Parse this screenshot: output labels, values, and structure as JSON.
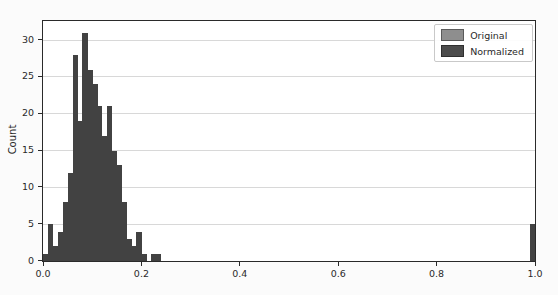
{
  "chart_data": {
    "type": "bar",
    "subtype": "histogram",
    "title": "",
    "xlabel": "",
    "ylabel": "Count",
    "xlim": [
      0.0,
      1.0
    ],
    "ylim": [
      0,
      32.6
    ],
    "x_tick_labels": [
      "0.0",
      "0.2",
      "0.4",
      "0.6",
      "0.8",
      "1.0"
    ],
    "x_tick_values": [
      0.0,
      0.2,
      0.4,
      0.6,
      0.8,
      1.0
    ],
    "y_tick_labels": [
      "0",
      "5",
      "10",
      "15",
      "20",
      "25",
      "30"
    ],
    "y_tick_values": [
      0,
      5,
      10,
      15,
      20,
      25,
      30
    ],
    "grid": "horizontal",
    "bin_width": 0.01,
    "bars": [
      {
        "x": 0.0,
        "count": 1
      },
      {
        "x": 0.01,
        "count": 5
      },
      {
        "x": 0.02,
        "count": 2
      },
      {
        "x": 0.03,
        "count": 4
      },
      {
        "x": 0.04,
        "count": 8
      },
      {
        "x": 0.05,
        "count": 12
      },
      {
        "x": 0.06,
        "count": 28
      },
      {
        "x": 0.07,
        "count": 19
      },
      {
        "x": 0.08,
        "count": 31
      },
      {
        "x": 0.09,
        "count": 26
      },
      {
        "x": 0.1,
        "count": 24
      },
      {
        "x": 0.11,
        "count": 21
      },
      {
        "x": 0.12,
        "count": 17
      },
      {
        "x": 0.13,
        "count": 21
      },
      {
        "x": 0.14,
        "count": 15
      },
      {
        "x": 0.15,
        "count": 13
      },
      {
        "x": 0.16,
        "count": 8
      },
      {
        "x": 0.17,
        "count": 3
      },
      {
        "x": 0.18,
        "count": 2
      },
      {
        "x": 0.19,
        "count": 4
      },
      {
        "x": 0.2,
        "count": 1
      },
      {
        "x": 0.22,
        "count": 1
      },
      {
        "x": 0.23,
        "count": 1
      },
      {
        "x": 0.99,
        "count": 5
      }
    ],
    "bar_color": "#424242",
    "gridline_color": "#d8d8d8",
    "legend": {
      "position": "upper-right",
      "entries": [
        {
          "label": "Original",
          "color": "#8e8e8e"
        },
        {
          "label": "Normalized",
          "color": "#4c4c4c"
        }
      ]
    }
  }
}
